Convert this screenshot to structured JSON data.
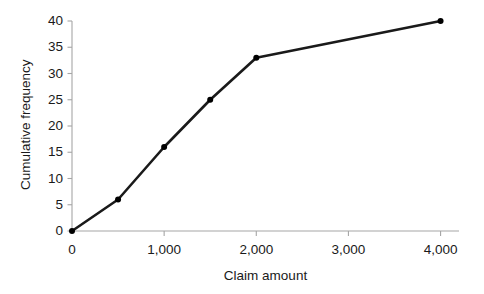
{
  "chart_data": {
    "type": "line",
    "title": "",
    "subtitle": "",
    "xlabel": "Claim amount",
    "ylabel": "Cumulative frequency",
    "xlim": [
      0,
      4200
    ],
    "ylim": [
      0,
      40
    ],
    "xticks": [
      0,
      1000,
      2000,
      3000,
      4000
    ],
    "xtick_labels": [
      "0",
      "1,000",
      "2,000",
      "3,000",
      "4,000"
    ],
    "yticks": [
      0,
      5,
      10,
      15,
      20,
      25,
      30,
      35,
      40
    ],
    "ytick_labels": [
      "0",
      "5",
      "10",
      "15",
      "20",
      "25",
      "30",
      "35",
      "40"
    ],
    "grid": false,
    "legend": null,
    "legend_position": "none",
    "annotations": [],
    "series": [
      {
        "name": "Cumulative frequency",
        "x": [
          0,
          500,
          1000,
          1500,
          2000,
          4000
        ],
        "values": [
          0,
          6,
          16,
          25,
          33,
          40
        ],
        "color": "#1a1a1a",
        "marker": "circle",
        "marker_size": 6,
        "line_width": 2.6
      }
    ]
  },
  "style": {
    "background": "#ffffff",
    "axis_color": "#a6a6a6",
    "tick_color": "#a6a6a6",
    "text_color": "#1a1a1a",
    "line_color": "#1a1a1a",
    "marker_color": "#1a1a1a"
  },
  "geometry": {
    "plot_left": 72,
    "plot_right": 459,
    "plot_top": 21,
    "plot_bottom": 231
  }
}
